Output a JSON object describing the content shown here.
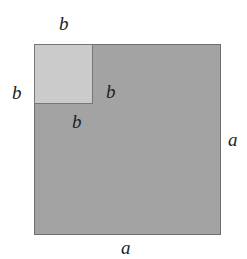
{
  "diagram": {
    "outer_square": {
      "side_label": "a",
      "fill": "#a3a3a3"
    },
    "inner_square": {
      "side_label": "b",
      "fill": "#cbcbcb"
    },
    "labels": {
      "inner_top": "b",
      "inner_left": "b",
      "inner_right": "b",
      "inner_bottom": "b",
      "outer_right": "a",
      "outer_bottom": "a"
    }
  }
}
